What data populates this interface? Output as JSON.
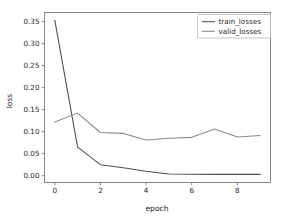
{
  "chart_data": {
    "type": "line",
    "title": "",
    "xlabel": "epoch",
    "ylabel": "loss",
    "x": [
      0,
      1,
      2,
      3,
      4,
      5,
      6,
      7,
      8,
      9
    ],
    "xlim": [
      -0.45,
      9.45
    ],
    "ylim": [
      -0.0155,
      0.3705
    ],
    "xticks": [
      0,
      2,
      4,
      6,
      8
    ],
    "xticklabels": [
      "0",
      "2",
      "4",
      "6",
      "8"
    ],
    "yticks": [
      0.0,
      0.05,
      0.1,
      0.15,
      0.2,
      0.25,
      0.3,
      0.35
    ],
    "yticklabels": [
      "0.00",
      "0.05",
      "0.10",
      "0.15",
      "0.20",
      "0.25",
      "0.30",
      "0.35"
    ],
    "grid": false,
    "legend_position": "upper right",
    "series": [
      {
        "name": "train_losses",
        "color": "#4d4d4d",
        "values": [
          0.353,
          0.065,
          0.025,
          0.018,
          0.01,
          0.004,
          0.003,
          0.003,
          0.003,
          0.003
        ]
      },
      {
        "name": "valid_losses",
        "color": "#8a8a8a",
        "values": [
          0.122,
          0.142,
          0.098,
          0.096,
          0.081,
          0.085,
          0.087,
          0.106,
          0.088,
          0.091
        ]
      }
    ]
  },
  "legend": {
    "entries": [
      {
        "label": "train_losses"
      },
      {
        "label": "valid_losses"
      }
    ]
  },
  "axes": {
    "x_title": "epoch",
    "y_title": "loss"
  }
}
